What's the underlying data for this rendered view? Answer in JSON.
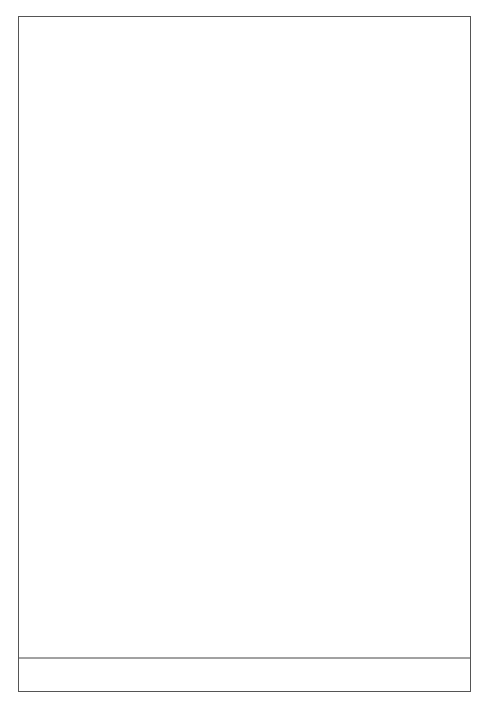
{
  "chart_data": {
    "type": "line",
    "title": "",
    "xlabel": "(ppm)",
    "ylabel": "",
    "xlim": [
      11.0,
      -3.0
    ],
    "x_reversed": true,
    "grid": false,
    "x_ticks": [
      10.5,
      9.0,
      7.5,
      6.0,
      4.5,
      3.0,
      1.5,
      0.0,
      -1.5
    ],
    "x_tick_labels": [
      "10.5",
      "9.0",
      "7.5",
      "6.0",
      "4.5",
      "3.0",
      "1.5",
      "0.0",
      "−1.5"
    ],
    "peak_labels": [
      {
        "group": 1,
        "values": [
          "5.3251",
          "5.3200"
        ]
      },
      {
        "group": 2,
        "values": [
          "3.8894",
          "3.5912",
          "3.4353"
        ]
      },
      {
        "group": 3,
        "values": [
          "1.6723"
        ]
      },
      {
        "group": 4,
        "values": [
          "1.2594",
          "1.1035",
          "1.0863",
          "0.7351"
        ]
      }
    ],
    "peaks": [
      {
        "ppm": 8.1,
        "rel_height": 0.02
      },
      {
        "ppm": 5.32,
        "rel_height": 0.21
      },
      {
        "ppm": 3.89,
        "rel_height": 0.09
      },
      {
        "ppm": 3.59,
        "rel_height": 0.17
      },
      {
        "ppm": 3.44,
        "rel_height": 0.45
      },
      {
        "ppm": 1.67,
        "rel_height": 0.01
      },
      {
        "ppm": 1.26,
        "rel_height": 0.27
      },
      {
        "ppm": 1.1,
        "rel_height": 1.0
      },
      {
        "ppm": 0.74,
        "rel_height": 0.02
      }
    ],
    "integrals": [
      {
        "label": "3.0",
        "from_ppm": 4.3,
        "to_ppm": 2.9,
        "marks": [
          3.8,
          3.4
        ]
      },
      {
        "label": "3.1",
        "from_ppm": 1.6,
        "to_ppm": 0.9,
        "marks": [
          1.4,
          1.0
        ]
      }
    ],
    "inset": {
      "description": "Magnified view of boxed region (~8.1 ppm)",
      "region_ppm": [
        9.1,
        7.3
      ],
      "xlabel": "(ppm)"
    },
    "annotations": [
      "Arrow from boxed baseline region to magnified inset"
    ]
  }
}
